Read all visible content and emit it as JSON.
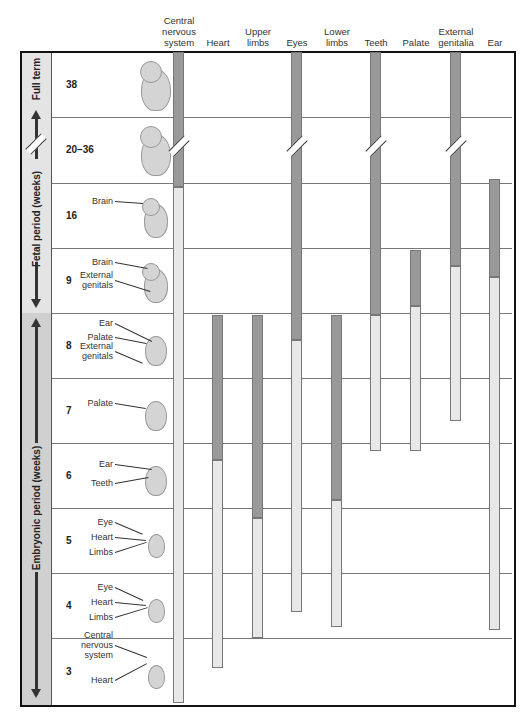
{
  "columns": [
    {
      "label_lines": [
        "Central",
        "nervous",
        "system"
      ],
      "x": 173
    },
    {
      "label_lines": [
        "Heart"
      ],
      "x": 212
    },
    {
      "label_lines": [
        "Upper",
        "limbs"
      ],
      "x": 252
    },
    {
      "label_lines": [
        "Eyes"
      ],
      "x": 291
    },
    {
      "label_lines": [
        "Lower",
        "limbs"
      ],
      "x": 331
    },
    {
      "label_lines": [
        "Teeth"
      ],
      "x": 370
    },
    {
      "label_lines": [
        "Palate"
      ],
      "x": 410
    },
    {
      "label_lines": [
        "External",
        "genitalia"
      ],
      "x": 450
    },
    {
      "label_lines": [
        "Ear"
      ],
      "x": 489
    }
  ],
  "periods": {
    "full_term": "Full term",
    "fetal": "Fetal period (weeks)",
    "embryonic": "Embryonic period (weeks)"
  },
  "rows": [
    {
      "week": "38",
      "labels": []
    },
    {
      "week": "20–36",
      "labels": []
    },
    {
      "week": "16",
      "labels": [
        "Brain"
      ]
    },
    {
      "week": "9",
      "labels": [
        "Brain",
        "External genitals"
      ]
    },
    {
      "week": "8",
      "labels": [
        "Ear",
        "Palate",
        "External genitals"
      ]
    },
    {
      "week": "7",
      "labels": [
        "Palate"
      ]
    },
    {
      "week": "6",
      "labels": [
        "Ear",
        "Teeth"
      ]
    },
    {
      "week": "5",
      "labels": [
        "Eye",
        "Heart",
        "Limbs"
      ]
    },
    {
      "week": "4",
      "labels": [
        "Eye",
        "Heart",
        "Limbs"
      ]
    },
    {
      "week": "3",
      "labels": [
        "Central nervous system",
        "Heart"
      ]
    }
  ],
  "legend_colors": {
    "highly_sensitive": "#999999",
    "less_sensitive": "#e8e8e8",
    "embryonic_strip": "#d0d0d0",
    "fetal_strip": "#e4e4e4"
  },
  "chart_data": {
    "type": "gantt",
    "y_axis": [
      "38",
      "20–36",
      "16",
      "9",
      "8",
      "7",
      "6",
      "5",
      "4",
      "3"
    ],
    "ylabel": "Weeks (Embryonic period 3–8, Fetal period 9–38)",
    "series": [
      {
        "name": "Central nervous system",
        "major_sensitivity": [
          "~15",
          "38"
        ],
        "minor_sensitivity": [
          "3",
          "~15"
        ]
      },
      {
        "name": "Heart",
        "major_sensitivity": [
          "~6.3",
          "8"
        ],
        "minor_sensitivity": [
          "~3.5",
          "~6.3"
        ]
      },
      {
        "name": "Upper limbs",
        "major_sensitivity": [
          "~5.4",
          "8"
        ],
        "minor_sensitivity": [
          "4",
          "~5.4"
        ]
      },
      {
        "name": "Eyes",
        "major_sensitivity": [
          "~7.6",
          "38"
        ],
        "minor_sensitivity": [
          "~4.4",
          "~7.6"
        ]
      },
      {
        "name": "Lower limbs",
        "major_sensitivity": [
          "~5.7",
          "8"
        ],
        "minor_sensitivity": [
          "~4.2",
          "~5.7"
        ]
      },
      {
        "name": "Teeth",
        "major_sensitivity": [
          "8",
          "38"
        ],
        "minor_sensitivity": [
          "~6.9",
          "8"
        ]
      },
      {
        "name": "Palate",
        "major_sensitivity": [
          "~8.1",
          "9"
        ],
        "minor_sensitivity": [
          "~6.9",
          "~8.1"
        ]
      },
      {
        "name": "External genitalia",
        "major_sensitivity": [
          "~8.7",
          "38"
        ],
        "minor_sensitivity": [
          "~7.3",
          "~8.7"
        ]
      },
      {
        "name": "Ear",
        "major_sensitivity": [
          "~8.5",
          "~16"
        ],
        "minor_sensitivity": [
          "~4.2",
          "~8.5"
        ]
      }
    ],
    "bars_px": [
      {
        "dark": [
          52,
          187
        ],
        "light": [
          187,
          703
        ]
      },
      {
        "dark": [
          315,
          460
        ],
        "light": [
          460,
          668
        ]
      },
      {
        "dark": [
          315,
          518
        ],
        "light": [
          518,
          638
        ]
      },
      {
        "dark": [
          52,
          340
        ],
        "light": [
          340,
          612
        ]
      },
      {
        "dark": [
          315,
          500
        ],
        "light": [
          500,
          627
        ]
      },
      {
        "dark": [
          52,
          315
        ],
        "light": [
          315,
          451
        ]
      },
      {
        "dark": [
          250,
          306
        ],
        "light": [
          306,
          451
        ]
      },
      {
        "dark": [
          52,
          266
        ],
        "light": [
          266,
          421
        ]
      },
      {
        "dark": [
          179,
          277
        ],
        "light": [
          277,
          630
        ]
      }
    ],
    "break_marks_on": [
      "Central nervous system",
      "Eyes",
      "Teeth",
      "External genitalia",
      "period-axis"
    ]
  }
}
